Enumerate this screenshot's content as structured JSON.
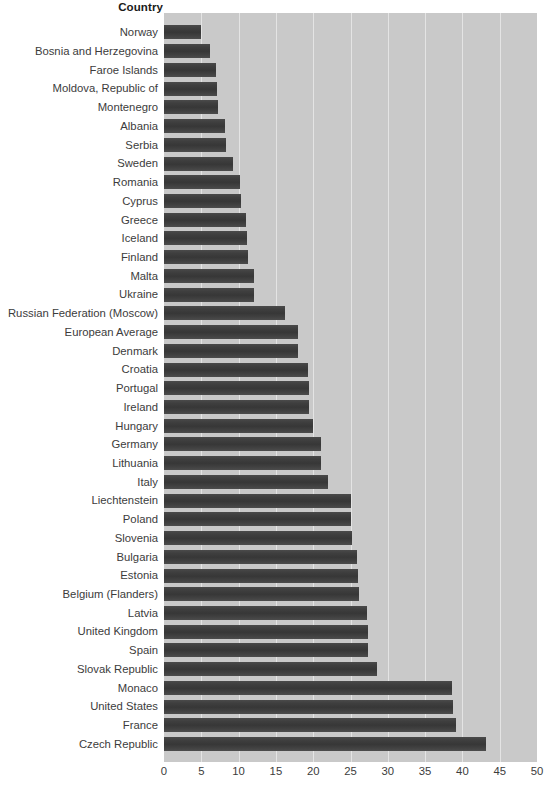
{
  "header": {
    "column_title": "Country"
  },
  "chart_data": {
    "type": "bar",
    "orientation": "horizontal",
    "title": "",
    "xlabel": "",
    "ylabel": "Country",
    "xlim": [
      0,
      50
    ],
    "xticks": [
      0,
      5,
      10,
      15,
      20,
      25,
      30,
      35,
      40,
      45,
      50
    ],
    "grid": true,
    "legend": "none",
    "plot_background": "#c9c9c9",
    "bar_color": "#3f3f3f",
    "gridline_color": "#e4e4e4",
    "categories": [
      "Norway",
      "Bosnia and Herzegovina",
      "Faroe Islands",
      "Moldova, Republic of",
      "Montenegro",
      "Albania",
      "Serbia",
      "Sweden",
      "Romania",
      "Cyprus",
      "Greece",
      "Iceland",
      "Finland",
      "Malta",
      "Ukraine",
      "Russian Federation (Moscow)",
      "European Average",
      "Denmark",
      "Croatia",
      "Portugal",
      "Ireland",
      "Hungary",
      "Germany",
      "Lithuania",
      "Italy",
      "Liechtenstein",
      "Poland",
      "Slovenia",
      "Bulgaria",
      "Estonia",
      "Belgium (Flanders)",
      "Latvia",
      "United Kingdom",
      "Spain",
      "Slovak Republic",
      "Monaco",
      "United States",
      "France",
      "Czech Republic"
    ],
    "values": [
      5.0,
      6.2,
      7.0,
      7.1,
      7.2,
      8.2,
      8.3,
      9.3,
      10.2,
      10.3,
      11.0,
      11.1,
      11.2,
      12.0,
      12.1,
      16.2,
      17.9,
      18.0,
      19.3,
      19.4,
      19.5,
      20.0,
      21.0,
      21.1,
      22.0,
      25.0,
      25.1,
      25.2,
      25.9,
      26.0,
      26.1,
      27.2,
      27.3,
      27.4,
      28.5,
      38.6,
      38.7,
      39.2,
      43.2
    ]
  }
}
